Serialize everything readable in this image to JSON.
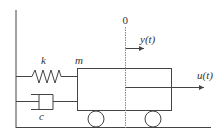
{
  "diagram": {
    "type": "mass-spring-damper-cart",
    "colors": {
      "stroke": "#444444",
      "dashed": "#888888",
      "text": "#333333",
      "background": "#ffffff"
    },
    "labels": {
      "spring": "k",
      "damper": "c",
      "mass": "m",
      "origin": "0",
      "displacement": "y(t)",
      "input": "u(t)"
    },
    "components": [
      {
        "name": "wall",
        "description": "fixed vertical wall on left"
      },
      {
        "name": "spring",
        "label": "k"
      },
      {
        "name": "damper",
        "label": "c"
      },
      {
        "name": "mass",
        "label": "m"
      },
      {
        "name": "wheels",
        "count": 2
      },
      {
        "name": "ground"
      },
      {
        "name": "reference-line",
        "label": "0"
      },
      {
        "name": "displacement-arrow",
        "label": "y(t)"
      },
      {
        "name": "force-arrow",
        "label": "u(t)"
      }
    ]
  }
}
